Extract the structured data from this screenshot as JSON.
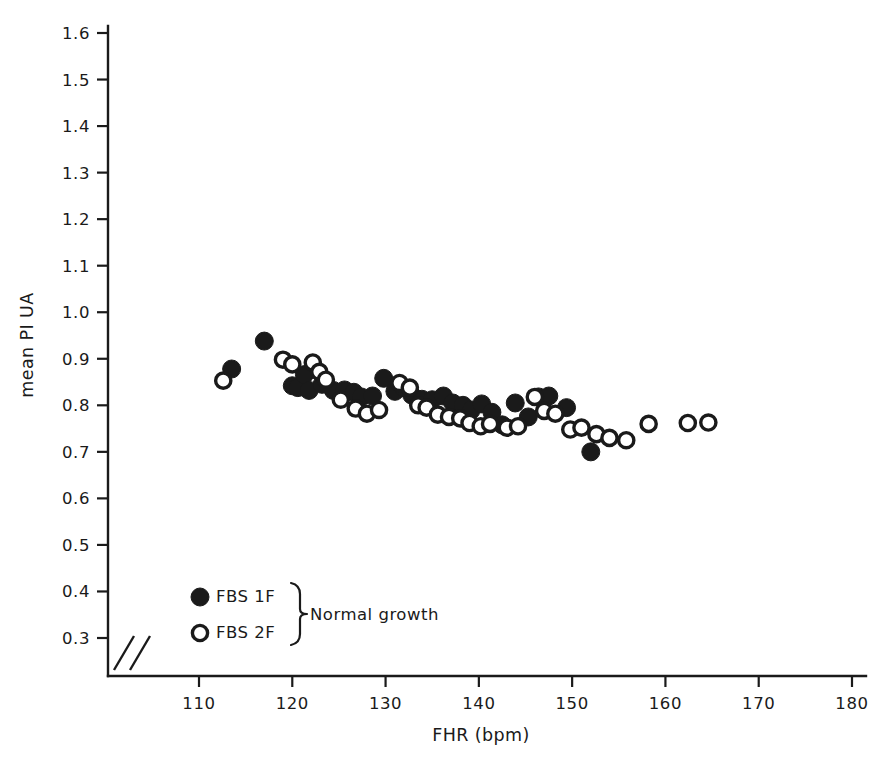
{
  "chart_data": {
    "type": "scatter",
    "title": "",
    "xlabel": "FHR (bpm)",
    "ylabel": "mean PI UA",
    "xlim": [
      105,
      183
    ],
    "ylim": [
      0.28,
      1.63
    ],
    "xticks": [
      110,
      120,
      130,
      140,
      150,
      160,
      170,
      180
    ],
    "yticks": [
      0.3,
      0.4,
      0.5,
      0.6,
      0.7,
      0.8,
      0.9,
      1.0,
      1.1,
      1.2,
      1.3,
      1.4,
      1.5,
      1.6
    ],
    "xtick_labels": [
      "110",
      "120",
      "130",
      "140",
      "150",
      "160",
      "170",
      "180"
    ],
    "ytick_labels": [
      "0.3",
      "0.4",
      "0.5",
      "0.6",
      "0.7",
      "0.8",
      "0.9",
      "1.0",
      "1.1",
      "1.2",
      "1.3",
      "1.4",
      "1.5",
      "1.6"
    ],
    "grid": false,
    "axis_break": true,
    "axis_break_note": "double-slash break mark at origin on both axes",
    "legend_position": "lower-left",
    "series": [
      {
        "name": "FBS 1F",
        "marker": "filled-circle",
        "color": "#1a1a1a",
        "points": [
          [
            113.5,
            0.878
          ],
          [
            117.0,
            0.938
          ],
          [
            120.0,
            0.842
          ],
          [
            120.6,
            0.838
          ],
          [
            121.3,
            0.866
          ],
          [
            121.8,
            0.832
          ],
          [
            123.2,
            0.845
          ],
          [
            124.4,
            0.832
          ],
          [
            125.6,
            0.833
          ],
          [
            126.6,
            0.828
          ],
          [
            127.4,
            0.818
          ],
          [
            128.6,
            0.82
          ],
          [
            129.8,
            0.858
          ],
          [
            131.0,
            0.83
          ],
          [
            131.9,
            0.838
          ],
          [
            132.8,
            0.822
          ],
          [
            133.9,
            0.813
          ],
          [
            135.0,
            0.812
          ],
          [
            136.2,
            0.82
          ],
          [
            137.2,
            0.805
          ],
          [
            138.3,
            0.8
          ],
          [
            139.2,
            0.79
          ],
          [
            140.3,
            0.803
          ],
          [
            141.4,
            0.785
          ],
          [
            142.5,
            0.758
          ],
          [
            143.9,
            0.805
          ],
          [
            145.3,
            0.775
          ],
          [
            146.4,
            0.818
          ],
          [
            147.5,
            0.82
          ],
          [
            149.4,
            0.795
          ],
          [
            152.0,
            0.7
          ]
        ]
      },
      {
        "name": "FBS 2F",
        "marker": "open-circle",
        "color": "#1a1a1a",
        "points": [
          [
            112.6,
            0.853
          ],
          [
            119.0,
            0.898
          ],
          [
            120.0,
            0.888
          ],
          [
            122.2,
            0.892
          ],
          [
            122.9,
            0.872
          ],
          [
            123.6,
            0.855
          ],
          [
            125.2,
            0.812
          ],
          [
            126.8,
            0.793
          ],
          [
            128.0,
            0.782
          ],
          [
            129.3,
            0.79
          ],
          [
            131.5,
            0.848
          ],
          [
            132.6,
            0.838
          ],
          [
            133.5,
            0.8
          ],
          [
            134.4,
            0.795
          ],
          [
            135.6,
            0.78
          ],
          [
            136.8,
            0.775
          ],
          [
            138.0,
            0.772
          ],
          [
            139.0,
            0.762
          ],
          [
            140.2,
            0.755
          ],
          [
            141.2,
            0.76
          ],
          [
            143.0,
            0.752
          ],
          [
            144.2,
            0.755
          ],
          [
            146.0,
            0.818
          ],
          [
            147.0,
            0.788
          ],
          [
            148.2,
            0.782
          ],
          [
            149.8,
            0.748
          ],
          [
            151.0,
            0.752
          ],
          [
            152.6,
            0.738
          ],
          [
            154.0,
            0.73
          ],
          [
            155.8,
            0.725
          ],
          [
            158.2,
            0.76
          ],
          [
            162.4,
            0.762
          ],
          [
            164.6,
            0.763
          ]
        ]
      }
    ]
  },
  "legend": {
    "entries": [
      {
        "label": "FBS 1F",
        "marker": "filled-circle"
      },
      {
        "label": "FBS 2F",
        "marker": "open-circle"
      }
    ],
    "brace_label": "Normal growth"
  },
  "axes": {
    "x_title": "FHR (bpm)",
    "y_title": "mean PI UA"
  }
}
